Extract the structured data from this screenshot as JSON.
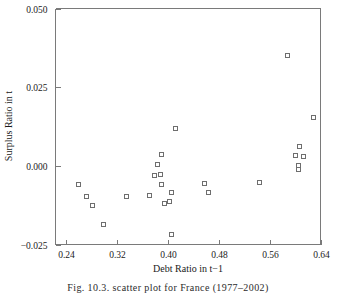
{
  "chart_data": {
    "type": "scatter",
    "title": "",
    "xlabel": "Debt Ratio in t−1",
    "ylabel": "Surplus Ratio in t",
    "xlim": [
      0.224,
      0.64
    ],
    "ylim": [
      -0.025,
      0.05
    ],
    "xticks": [
      0.24,
      0.32,
      0.4,
      0.48,
      0.56,
      0.64
    ],
    "xtick_labels": [
      "0.24",
      "0.32",
      "0.40",
      "0.48",
      "0.56",
      "0.64"
    ],
    "yticks": [
      -0.025,
      0.0,
      0.025,
      0.05
    ],
    "ytick_labels": [
      "−0.025",
      "0.000",
      "0.025",
      "0.050"
    ],
    "grid": false,
    "legend": "none",
    "marker": "open-square",
    "marker_color": "#6e6e6e",
    "points": [
      {
        "x": 0.2595,
        "y": -0.0057
      },
      {
        "x": 0.2717,
        "y": -0.0095
      },
      {
        "x": 0.2812,
        "y": -0.0124
      },
      {
        "x": 0.2988,
        "y": -0.0184
      },
      {
        "x": 0.3339,
        "y": -0.0095
      },
      {
        "x": 0.3785,
        "y": -0.0029
      },
      {
        "x": 0.3839,
        "y": 0.0006
      },
      {
        "x": 0.3704,
        "y": -0.0092
      },
      {
        "x": 0.3893,
        "y": 0.0038
      },
      {
        "x": 0.388,
        "y": -0.0025
      },
      {
        "x": 0.3893,
        "y": -0.0057
      },
      {
        "x": 0.3947,
        "y": -0.0117
      },
      {
        "x": 0.4028,
        "y": -0.0111
      },
      {
        "x": 0.4055,
        "y": -0.0082
      },
      {
        "x": 0.4122,
        "y": 0.012
      },
      {
        "x": 0.4055,
        "y": -0.0216
      },
      {
        "x": 0.4568,
        "y": -0.0054
      },
      {
        "x": 0.4636,
        "y": -0.0083
      },
      {
        "x": 0.5432,
        "y": -0.0051
      },
      {
        "x": 0.5878,
        "y": 0.0353
      },
      {
        "x": 0.6,
        "y": 0.0035
      },
      {
        "x": 0.6054,
        "y": 0.0002
      },
      {
        "x": 0.6054,
        "y": -0.0011
      },
      {
        "x": 0.6068,
        "y": 0.0063
      },
      {
        "x": 0.6122,
        "y": 0.0031
      },
      {
        "x": 0.6284,
        "y": 0.0155
      }
    ]
  },
  "caption": {
    "text": "Fig. 10.3.  scatter plot for France (1977–2002)"
  }
}
